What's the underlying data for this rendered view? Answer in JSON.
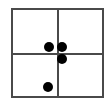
{
  "figure": {
    "background_color": "#ffffff",
    "frame": {
      "name": "plot-border",
      "left": 11,
      "top": 8,
      "width": 93,
      "height": 90,
      "border_width": 2,
      "border_color": "#4a4a4a"
    },
    "dividers": [
      {
        "name": "vertical-divider",
        "orientation": "vertical",
        "position": 57,
        "thickness": 2,
        "color": "#4a4a4a"
      },
      {
        "name": "horizontal-divider",
        "orientation": "horizontal",
        "position": 53,
        "thickness": 2,
        "color": "#4a4a4a"
      }
    ]
  },
  "chart_data": {
    "type": "scatter",
    "title": "",
    "xlabel": "",
    "ylabel": "",
    "grid": true,
    "legend": false,
    "xlim": [
      11,
      104
    ],
    "ylim": [
      8,
      98
    ],
    "quadrant_split": {
      "x": 57,
      "y": 53
    },
    "point_color": "#000000",
    "point_radius": 5,
    "points": [
      {
        "label": "dot-1",
        "x": 49,
        "y": 47,
        "r": 5,
        "quadrant": "top-left"
      },
      {
        "label": "dot-2",
        "x": 62,
        "y": 47,
        "r": 5,
        "quadrant": "top-right"
      },
      {
        "label": "dot-3",
        "x": 62,
        "y": 59,
        "r": 5,
        "quadrant": "bottom-right"
      },
      {
        "label": "dot-4",
        "x": 48,
        "y": 87,
        "r": 5,
        "quadrant": "bottom-left"
      }
    ]
  }
}
